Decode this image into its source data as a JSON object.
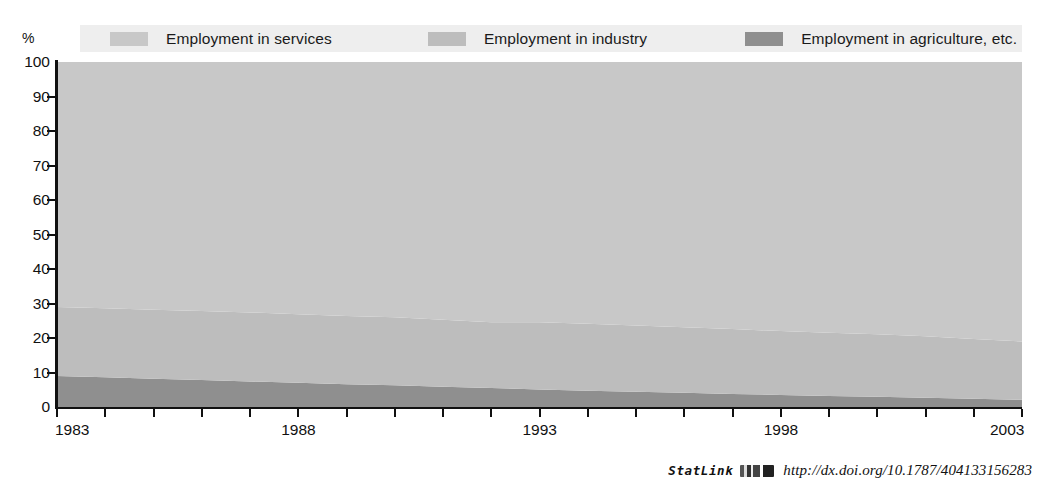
{
  "unit_label": "%",
  "legend": {
    "items": [
      {
        "label": "Employment in services",
        "color": "#c8c8c8",
        "key": "services"
      },
      {
        "label": "Employment in industry",
        "color": "#bdbdbd",
        "key": "industry"
      },
      {
        "label": "Employment in agriculture, etc.",
        "color": "#8f8f8f",
        "key": "agriculture"
      }
    ]
  },
  "statlink": {
    "word": "StatLink",
    "glyph": "barcode-icon",
    "url": "http://dx.doi.org/10.1787/404133156283"
  },
  "chart_data": {
    "type": "area",
    "stacked": true,
    "percent": true,
    "title": "",
    "subtitle": "",
    "xlabel": "",
    "ylabel": "%",
    "ylim": [
      0,
      100
    ],
    "yticks": [
      0,
      10,
      20,
      30,
      40,
      50,
      60,
      70,
      80,
      90,
      100
    ],
    "xlim": [
      1983,
      2003
    ],
    "xticks": [
      1983,
      1988,
      1993,
      1998,
      2003
    ],
    "xtick_labels": [
      "1983",
      "1988",
      "1993",
      "1998",
      "2003"
    ],
    "x": [
      1983,
      1984,
      1985,
      1986,
      1987,
      1988,
      1989,
      1990,
      1991,
      1992,
      1993,
      1994,
      1995,
      1996,
      1997,
      1998,
      1999,
      2000,
      2001,
      2002,
      2003
    ],
    "grid": false,
    "legend_position": "top",
    "series": [
      {
        "name": "Employment in agriculture, etc.",
        "color": "#8f8f8f",
        "values": [
          9.0,
          8.6,
          8.2,
          7.8,
          7.4,
          7.0,
          6.6,
          6.3,
          5.9,
          5.5,
          5.1,
          4.7,
          4.4,
          4.1,
          3.8,
          3.5,
          3.2,
          3.0,
          2.7,
          2.4,
          2.1
        ]
      },
      {
        "name": "Employment in industry",
        "color": "#bdbdbd",
        "values": [
          20.0,
          20.0,
          20.0,
          20.0,
          20.0,
          19.9,
          19.8,
          19.7,
          19.4,
          19.1,
          19.5,
          19.4,
          19.2,
          19.0,
          18.8,
          18.5,
          18.3,
          18.1,
          17.8,
          17.3,
          16.9
        ]
      },
      {
        "name": "Employment in services",
        "color": "#c8c8c8",
        "values": [
          71.0,
          71.4,
          71.8,
          72.2,
          72.6,
          73.1,
          73.6,
          74.0,
          74.7,
          75.4,
          75.4,
          75.9,
          76.4,
          76.9,
          77.4,
          78.0,
          78.5,
          78.9,
          79.5,
          80.3,
          81.0
        ]
      }
    ]
  }
}
